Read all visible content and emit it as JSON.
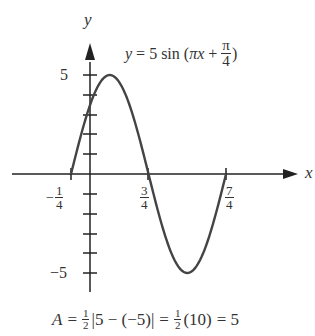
{
  "chart_data": {
    "type": "line",
    "equation": {
      "lhs": "y",
      "eq": "=",
      "coef": "5",
      "fn": "sin",
      "arg_open": "(",
      "arg_var": "πx",
      "plus": "+",
      "frac_num": "π",
      "frac_den": "4",
      "arg_close": ")"
    },
    "xlabel": "x",
    "ylabel": "y",
    "x_ticks": [
      {
        "value": -0.25,
        "num": "1",
        "den": "4",
        "sign": "−"
      },
      {
        "value": 0.75,
        "num": "3",
        "den": "4",
        "sign": ""
      },
      {
        "value": 1.75,
        "num": "7",
        "den": "4",
        "sign": ""
      }
    ],
    "y_tick_labels": [
      {
        "value": 5,
        "label": "5"
      },
      {
        "value": -5,
        "label": "−5"
      }
    ],
    "y_ticks": [
      5,
      4,
      3,
      2,
      1,
      -1,
      -2,
      -3,
      -4,
      -5
    ],
    "xlim": [
      -0.25,
      1.75
    ],
    "ylim": [
      -5,
      5
    ],
    "grid": false,
    "series": [
      {
        "name": "y = 5 sin(πx + π/4)",
        "x": [
          -0.25,
          0,
          0.25,
          0.5,
          0.75,
          1.0,
          1.25,
          1.5,
          1.75
        ],
        "values": [
          0,
          3.54,
          5,
          3.54,
          0,
          -3.54,
          -5,
          -3.54,
          0
        ]
      }
    ],
    "annotation": {
      "A": "A",
      "eq1": "=",
      "half1_num": "1",
      "half1_den": "2",
      "abs_expr": "|5 − (−5)|",
      "eq2": "=",
      "half2_num": "1",
      "half2_den": "2",
      "paren": "(10)",
      "eq3": "= 5"
    }
  }
}
